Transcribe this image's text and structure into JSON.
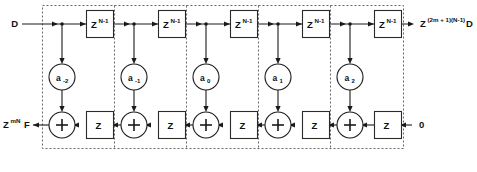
{
  "diagram": {
    "input_label": {
      "text": "D"
    },
    "output_top": {
      "base": "Z",
      "exponent": "(2m + 1)(N-1)",
      "suffix": "D"
    },
    "output_bottom": {
      "base": "Z",
      "exponent": "mN",
      "suffix": "F"
    },
    "input_bottom": {
      "text": "0"
    },
    "top_delay_label": {
      "base": "Z",
      "exponent": "N-1"
    },
    "bottom_delay_label": {
      "base": "Z"
    },
    "adder_symbol": "+",
    "cells": [
      {
        "coefficient_base": "a",
        "coefficient_sub": "-2"
      },
      {
        "coefficient_base": "a",
        "coefficient_sub": "-1"
      },
      {
        "coefficient_base": "a",
        "coefficient_sub": "0"
      },
      {
        "coefficient_base": "a",
        "coefficient_sub": "1"
      },
      {
        "coefficient_base": "a",
        "coefficient_sub": "2"
      }
    ],
    "colors": {
      "wire": "#1a1a1a",
      "box_stroke": "#2a2a2a",
      "dashed_boundary": "#555555",
      "background": "#ffffff",
      "text": "#111111"
    }
  }
}
